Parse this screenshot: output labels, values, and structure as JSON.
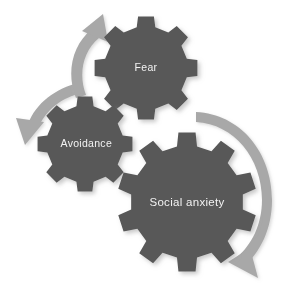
{
  "diagram": {
    "type": "gear-cycle-diagram",
    "background_color": "#ffffff",
    "gear_color": "#585858",
    "gear_shadow_color": "#cfcfcf",
    "arrow_color": "#a8a8a8",
    "label_color": "#f2f2f2",
    "title": "",
    "gears": [
      {
        "id": "fear",
        "label": "Fear",
        "center_x": 146,
        "center_y": 68,
        "radius": 52,
        "teeth": 8
      },
      {
        "id": "avoidance",
        "label": "Avoidance",
        "center_x": 85,
        "center_y": 144,
        "radius": 48,
        "teeth": 8
      },
      {
        "id": "social-anxiety",
        "label": "Social anxiety",
        "center_x": 187,
        "center_y": 202,
        "radius": 70,
        "teeth": 10
      }
    ],
    "arrows": [
      {
        "id": "arrow-upper-left",
        "from": "avoidance",
        "to": "fear",
        "direction": "counter-clockwise-up",
        "head_position": "top"
      },
      {
        "id": "arrow-lower-left",
        "from": "fear",
        "to": "avoidance",
        "direction": "counter-clockwise-down",
        "head_position": "bottom-left"
      },
      {
        "id": "arrow-right",
        "from": "fear",
        "to": "social-anxiety",
        "direction": "clockwise",
        "head_position": "bottom-right"
      }
    ]
  }
}
